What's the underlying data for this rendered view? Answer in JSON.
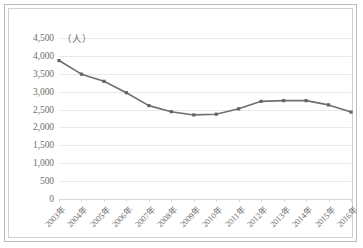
{
  "chart_data": {
    "type": "line",
    "title": "",
    "xlabel": "",
    "ylabel": "",
    "unit_label": "（人）",
    "ylim": [
      0,
      4500
    ],
    "ytick_step": 500,
    "yticks": [
      "0",
      "500",
      "1,000",
      "1,500",
      "2,000",
      "2,500",
      "3,000",
      "3,500",
      "4,000",
      "4,500"
    ],
    "ytick_values": [
      0,
      500,
      1000,
      1500,
      2000,
      2500,
      3000,
      3500,
      4000,
      4500
    ],
    "grid": "horizontal",
    "legend": "none",
    "categories": [
      "2003年",
      "2004年",
      "2005年",
      "2006年",
      "2007年",
      "2008年",
      "2009年",
      "2010年",
      "2011年",
      "2012年",
      "2013年",
      "2014年",
      "2015年",
      "2016年"
    ],
    "values": [
      3870,
      3490,
      3290,
      2970,
      2610,
      2440,
      2350,
      2370,
      2520,
      2730,
      2750,
      2750,
      2630,
      2430
    ],
    "series": [
      {
        "name": "人数",
        "values": [
          3870,
          3490,
          3290,
          2970,
          2610,
          2440,
          2350,
          2370,
          2520,
          2730,
          2750,
          2750,
          2630,
          2430
        ]
      }
    ],
    "marker": "square",
    "colors": {
      "line": "#6b7268",
      "marker": "#5f6760",
      "grid": "#e9e9e6",
      "axis": "#d8d9d6",
      "text": "#6e6e6c",
      "frame_outer": "#b9bbb8",
      "frame_inner": "#cfd1ce",
      "background": "#ffffff"
    }
  }
}
